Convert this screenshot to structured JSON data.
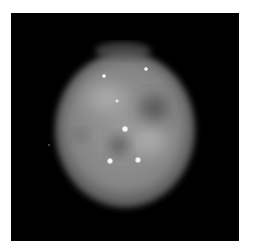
{
  "image": {
    "subject": "planetary nebula (grayscale telescope image)",
    "background_color": "#ffffff",
    "frame_color": "#000000",
    "nebula": {
      "center": [
        114,
        115
      ],
      "radius_x": 67,
      "radius_y": 76,
      "color": "#8a8a8a"
    },
    "stars": [
      {
        "x": 93,
        "y": 63,
        "r": 1.4
      },
      {
        "x": 135,
        "y": 56,
        "r": 1.4
      },
      {
        "x": 106,
        "y": 88,
        "r": 1.2
      },
      {
        "x": 114,
        "y": 116,
        "r": 2.4
      },
      {
        "x": 99,
        "y": 148,
        "r": 2.2
      },
      {
        "x": 127,
        "y": 147,
        "r": 2.2
      },
      {
        "x": 38,
        "y": 132,
        "r": 0.8
      }
    ]
  }
}
